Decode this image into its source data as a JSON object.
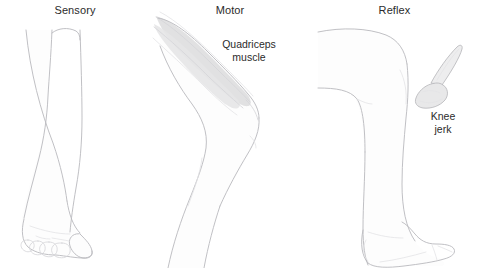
{
  "figure": {
    "title": "",
    "background_color": "#ffffff",
    "ink_color": "#b9b9bd",
    "text_color": "#2b2b2b",
    "width": 479,
    "height": 268
  },
  "panels": [
    {
      "id": "sensory",
      "title": "Sensory",
      "illustration": "front view of lower leg and foot with five toes"
    },
    {
      "id": "motor",
      "title": "Motor",
      "illustration": "side view of bent leg with shaded quadriceps muscle fibers"
    },
    {
      "id": "reflex",
      "title": "Reflex",
      "illustration": "side view of leg at knee with reflex hammer"
    }
  ],
  "callouts": [
    {
      "id": "quadriceps",
      "text": "Quadriceps\nmuscle",
      "panel": "motor"
    },
    {
      "id": "knee-jerk",
      "text": "Knee\njerk",
      "panel": "reflex"
    }
  ],
  "icons": {
    "reflex_hammer": "reflex-hammer-icon"
  }
}
